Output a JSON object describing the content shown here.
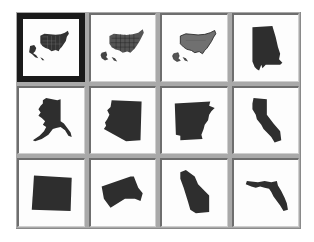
{
  "gallery": {
    "selected_index": 0,
    "colors": {
      "gutter": "#a9a9a9",
      "cell_bg": "#fdfdfd",
      "shape_fill": "#2e2e2e",
      "shape_fill_light": "#6a6a6a",
      "selected_border": "#1a1a1a"
    },
    "items": [
      {
        "name": "United States (states, selected)",
        "icon": "usa-states-map-icon"
      },
      {
        "name": "United States (states)",
        "icon": "usa-states-map-icon"
      },
      {
        "name": "United States (outline)",
        "icon": "usa-outline-map-icon"
      },
      {
        "name": "Alabama",
        "icon": "alabama-map-icon"
      },
      {
        "name": "Alaska",
        "icon": "alaska-map-icon"
      },
      {
        "name": "Arizona",
        "icon": "arizona-map-icon"
      },
      {
        "name": "Arkansas",
        "icon": "arkansas-map-icon"
      },
      {
        "name": "California",
        "icon": "california-map-icon"
      },
      {
        "name": "Colorado",
        "icon": "colorado-map-icon"
      },
      {
        "name": "Connecticut",
        "icon": "connecticut-map-icon"
      },
      {
        "name": "Delaware",
        "icon": "delaware-map-icon"
      },
      {
        "name": "Florida",
        "icon": "florida-map-icon"
      }
    ]
  }
}
